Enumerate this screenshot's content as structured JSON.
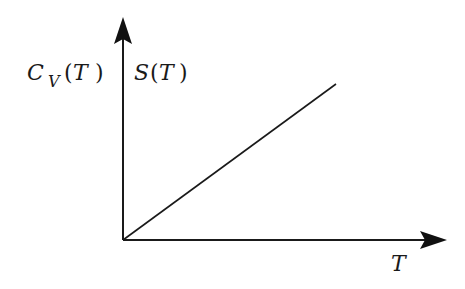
{
  "diagram": {
    "y_axis_label_left": {
      "main": "C",
      "subscript": "V",
      "arg": "T"
    },
    "y_axis_label_right": {
      "main": "S",
      "arg": "T"
    },
    "x_axis_label": "T",
    "line": {
      "from": [
        0,
        0
      ],
      "to": [
        1,
        1
      ],
      "description": "linear increase"
    },
    "colors": {
      "stroke": "#1a1a1a",
      "background": "#ffffff"
    }
  }
}
